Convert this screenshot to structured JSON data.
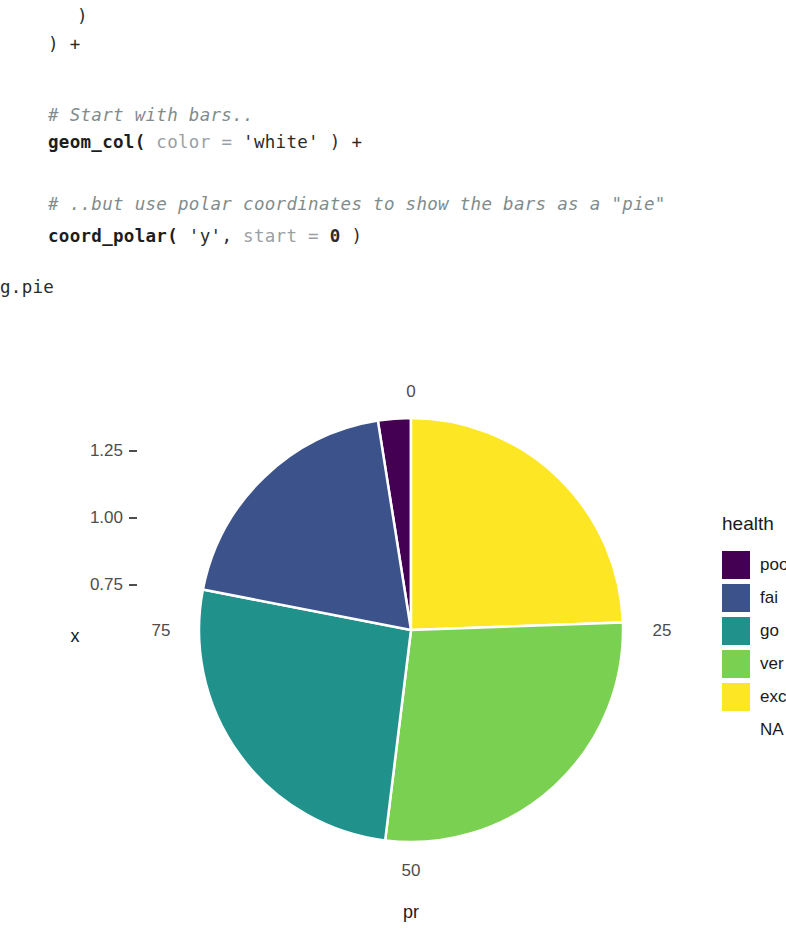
{
  "notebook": {
    "code_lines": [
      {
        "indent": 77,
        "top": 8,
        "segments": [
          {
            "cls": "tok-plain",
            "text": ")"
          }
        ]
      },
      {
        "indent": 48,
        "top": 36,
        "segments": [
          {
            "cls": "tok-plain",
            "text": ") +"
          }
        ]
      },
      {
        "indent": 48,
        "top": 107,
        "segments": [
          {
            "cls": "tok-comment",
            "text": "# Start with bars.."
          }
        ]
      },
      {
        "indent": 48,
        "top": 134,
        "segments": [
          {
            "cls": "tok-fn",
            "text": "geom_col("
          },
          {
            "cls": "tok-arg",
            "text": " color = "
          },
          {
            "cls": "tok-str",
            "text": "'white'"
          },
          {
            "cls": "tok-plain",
            "text": " ) +"
          }
        ]
      },
      {
        "indent": 48,
        "top": 196,
        "segments": [
          {
            "cls": "tok-comment",
            "text": "# ..but use polar coordinates to show the bars as a \"pie\""
          }
        ]
      },
      {
        "indent": 48,
        "top": 228,
        "segments": [
          {
            "cls": "tok-fn",
            "text": "coord_polar("
          },
          {
            "cls": "tok-str",
            "text": " 'y'"
          },
          {
            "cls": "tok-plain",
            "text": ", "
          },
          {
            "cls": "tok-arg",
            "text": "start = "
          },
          {
            "cls": "tok-num",
            "text": "0"
          },
          {
            "cls": "tok-plain",
            "text": " )"
          }
        ]
      }
    ],
    "output_label": "g.pie"
  },
  "chart_data": {
    "type": "pie",
    "title": "",
    "xlabel": "pr",
    "ylabel": "x",
    "legend_title": "health",
    "legend_position": "right",
    "grid": false,
    "start_angle_deg": 0,
    "direction": "clockwise",
    "angular_axis": {
      "name": "pr",
      "ticks": [
        {
          "label": "0",
          "angle_deg": 0
        },
        {
          "label": "25",
          "angle_deg": 90
        },
        {
          "label": "50",
          "angle_deg": 180
        },
        {
          "label": "75",
          "angle_deg": 270
        }
      ],
      "range": [
        0,
        100
      ]
    },
    "radial_axis": {
      "name": "x",
      "ticks": [
        "0.75",
        "1.00",
        "1.25"
      ],
      "values": [
        0.75,
        1.0,
        1.25
      ]
    },
    "categories": [
      "poor",
      "fair",
      "good",
      "very good",
      "excellent",
      "NA"
    ],
    "labels_clipped": [
      "poo",
      "fai",
      "go",
      "ver",
      "exc",
      "NA"
    ],
    "values": [
      3.5,
      10.5,
      26.0,
      28.0,
      32.0,
      0
    ],
    "colors": [
      "#440154",
      "#3b528b",
      "#21918c",
      "#7ad151",
      "#fde725",
      "#ffffff"
    ],
    "slices": [
      {
        "name": "poor",
        "label_clipped": "poo",
        "percent": 3.5,
        "color": "#440154",
        "start_deg": 351.0,
        "end_deg": 360.0
      },
      {
        "name": "excellent",
        "label_clipped": "exc",
        "percent": 24.5,
        "color": "#fde725",
        "start_deg": 0.0,
        "end_deg": 88.0
      },
      {
        "name": "very good",
        "label_clipped": "ver",
        "percent": 27.5,
        "color": "#7ad151",
        "start_deg": 88.0,
        "end_deg": 187.0
      },
      {
        "name": "good",
        "label_clipped": "go",
        "percent": 26.0,
        "color": "#21918c",
        "start_deg": 187.0,
        "end_deg": 281.0
      },
      {
        "name": "fair",
        "label_clipped": "fai",
        "percent": 19.5,
        "color": "#3b528b",
        "start_deg": 281.0,
        "end_deg": 351.0
      }
    ],
    "slice_border_color": "#ffffff",
    "background": "#ffffff"
  },
  "plot_geometry": {
    "center_x": 411,
    "center_y": 300,
    "radius": 212,
    "tick_label_0": "0",
    "tick_label_25": "25",
    "tick_label_50": "50",
    "tick_label_75": "75",
    "y_tick_125": "1.25",
    "y_tick_100": "1.00",
    "y_tick_075": "0.75",
    "y_axis_title": "x",
    "x_axis_title": "pr"
  },
  "legend": {
    "title": "health",
    "entries": [
      {
        "label": "poo",
        "color": "#440154",
        "has_swatch": true
      },
      {
        "label": "fai",
        "color": "#3b528b",
        "has_swatch": true
      },
      {
        "label": "go",
        "color": "#21918c",
        "has_swatch": true
      },
      {
        "label": "ver",
        "color": "#7ad151",
        "has_swatch": true
      },
      {
        "label": "exc",
        "color": "#fde725",
        "has_swatch": true
      },
      {
        "label": "NA",
        "color": "",
        "has_swatch": false
      }
    ]
  }
}
